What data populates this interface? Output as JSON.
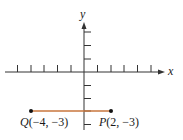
{
  "diagram": {
    "axes": {
      "x_label": "x",
      "y_label": "y",
      "x_ticks": [
        -5,
        -4,
        -3,
        -2,
        -1,
        1,
        2,
        3,
        4,
        5
      ],
      "y_ticks": [
        -4,
        -3,
        -2,
        -1,
        1,
        2,
        3
      ]
    },
    "points": [
      {
        "name": "Q",
        "coords": "(−4, −3)",
        "x": -4,
        "y": -3
      },
      {
        "name": "P",
        "coords": "(2, −3)",
        "x": 2,
        "y": -3
      }
    ],
    "segment": {
      "from": "Q",
      "to": "P",
      "color": "#c8763c"
    },
    "colors": {
      "axis": "#333333",
      "point": "#111111"
    }
  }
}
